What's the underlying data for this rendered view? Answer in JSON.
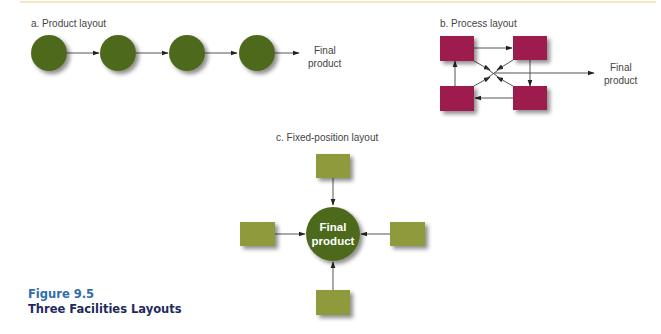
{
  "figure": {
    "number": "Figure 9.5",
    "title": "Three Facilities Layouts"
  },
  "colors": {
    "product_station": "#4e6b1f",
    "process_department": "#9e1b4e",
    "fixed_resource": "#8f9a3c",
    "fixed_product": "#4e6b1f",
    "arrow": "#333333",
    "caption_number": "#2f6ea8",
    "caption_title": "#1e2a5e",
    "top_rule": "#f7e6c4"
  },
  "panels": {
    "product": {
      "label": "a. Product layout",
      "stations": 4,
      "output_line1": "Final",
      "output_line2": "product"
    },
    "process": {
      "label": "b. Process layout",
      "departments": 4,
      "output_line1": "Final",
      "output_line2": "product"
    },
    "fixed": {
      "label": "c. Fixed-position layout",
      "resources": 4,
      "center_line1": "Final",
      "center_line2": "product"
    }
  }
}
